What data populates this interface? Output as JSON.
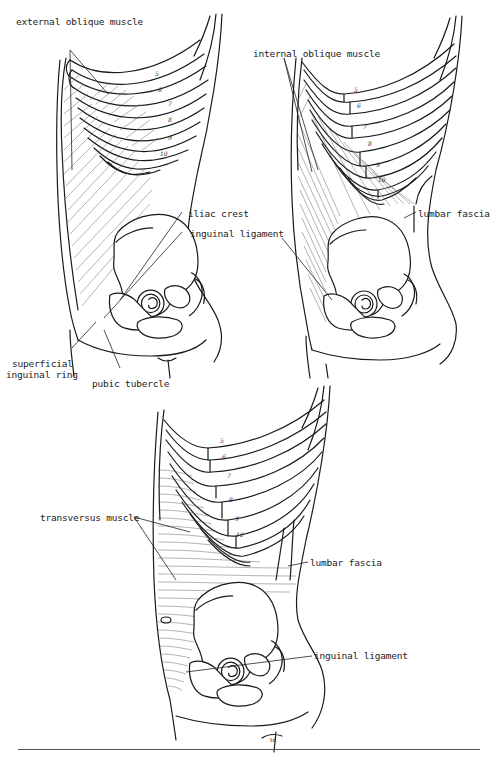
{
  "figures": [
    {
      "id": "top-left",
      "labels": {
        "external_oblique": "external oblique muscle",
        "iliac_crest": "iliac crest",
        "inguinal_ligament": "inguinal ligament",
        "superficial_ring_line1": "superficial",
        "superficial_ring_line2": "inguinal ring",
        "pubic_tubercle": "pubic tubercle"
      },
      "rib_numbers": [
        "5",
        "6",
        "7",
        "8",
        "9",
        "10",
        "11"
      ]
    },
    {
      "id": "top-right",
      "labels": {
        "internal_oblique": "internal oblique muscle",
        "lumbar_fascia": "lumbar fascia",
        "inguinal_ligament_fragment": "gament"
      },
      "rib_numbers": [
        "5",
        "6",
        "7",
        "8",
        "9",
        "10",
        "11"
      ]
    },
    {
      "id": "bottom",
      "labels": {
        "transversus": "transversus muscle",
        "lumbar_fascia": "lumbar fascia",
        "inguinal_ligament": "inguinal ligament"
      },
      "rib_numbers": [
        "5",
        "6",
        "7",
        "8",
        "9",
        "10",
        "11"
      ]
    }
  ],
  "signature": "td"
}
